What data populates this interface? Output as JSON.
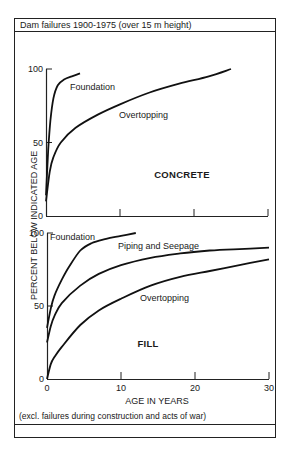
{
  "title": "Dam failures 1900-1975 (over 15 m height)",
  "footnote": "(excl. failures during construction and acts of war)",
  "ylabel": "PERCENT BELOW INDICATED AGE",
  "xlabel": "AGE IN YEARS",
  "panels": [
    {
      "name": "CONCRETE",
      "yticks": [
        "100",
        "50",
        "0"
      ]
    },
    {
      "name": "FILL",
      "yticks": [
        "100",
        "50",
        "0"
      ],
      "xticks": [
        "0",
        "10",
        "20",
        "30"
      ]
    }
  ],
  "chart_data": [
    {
      "type": "line",
      "title": "CONCRETE",
      "xlabel": "AGE IN YEARS",
      "ylabel": "PERCENT BELOW INDICATED AGE",
      "xlim": [
        0,
        30
      ],
      "ylim": [
        0,
        100
      ],
      "xticks": [
        0,
        10,
        20,
        30
      ],
      "yticks": [
        0,
        50,
        100
      ],
      "grid": false,
      "series": [
        {
          "name": "Foundation",
          "x": [
            0,
            0.3,
            0.6,
            1.0,
            1.6,
            2.5,
            3.5,
            4.6
          ],
          "y": [
            14,
            45,
            65,
            80,
            89,
            93,
            95,
            97
          ]
        },
        {
          "name": "Overtopping",
          "x": [
            0,
            0.5,
            1,
            2,
            4,
            7,
            10,
            14,
            18,
            22,
            25
          ],
          "y": [
            10,
            30,
            40,
            50,
            60,
            69,
            76,
            84,
            90,
            95,
            100
          ]
        }
      ]
    },
    {
      "type": "line",
      "title": "FILL",
      "xlabel": "AGE IN YEARS",
      "ylabel": "PERCENT BELOW INDICATED AGE",
      "xlim": [
        0,
        30
      ],
      "ylim": [
        0,
        100
      ],
      "xticks": [
        0,
        10,
        20,
        30
      ],
      "yticks": [
        0,
        50,
        100
      ],
      "grid": false,
      "series": [
        {
          "name": "Foundation",
          "x": [
            0,
            0.5,
            1,
            2,
            3,
            4.5,
            6,
            8,
            10,
            12
          ],
          "y": [
            35,
            48,
            57,
            68,
            77,
            88,
            93,
            96,
            98,
            100
          ]
        },
        {
          "name": "Piping and Seepage",
          "x": [
            0,
            0.5,
            1,
            2,
            4.5,
            7,
            10,
            14,
            18,
            22,
            26,
            30
          ],
          "y": [
            25,
            36,
            43,
            52,
            64,
            72,
            78,
            83,
            86,
            88,
            89,
            90
          ]
        },
        {
          "name": "Overtopping",
          "x": [
            0,
            0.5,
            1,
            2,
            4.5,
            7,
            10,
            14,
            18,
            22,
            26,
            30
          ],
          "y": [
            0,
            10,
            15,
            22,
            37,
            47,
            55,
            64,
            70,
            74,
            78,
            82
          ]
        }
      ]
    }
  ]
}
